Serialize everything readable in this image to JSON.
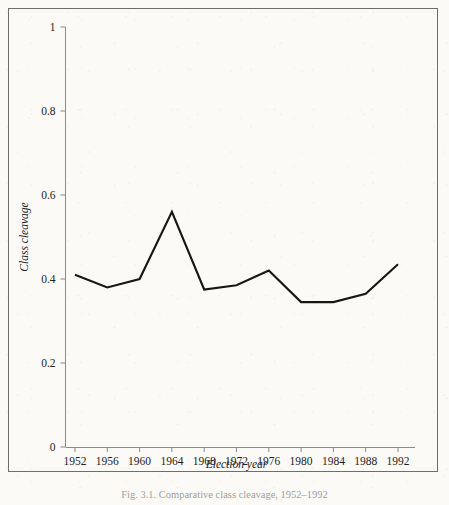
{
  "figure": {
    "caption": "Fig. 3.1.  Comparative class cleavage, 1952–1992",
    "background_color": "#fbfaf7",
    "frame_color": "#6e6e70",
    "line_color": "#161616",
    "axis_color": "#8a8a8c"
  },
  "chart_data": {
    "type": "line",
    "title": "",
    "xlabel": "Election year",
    "ylabel": "Class cleavage",
    "categories": [
      "1952",
      "1956",
      "1960",
      "1964",
      "1968",
      "1972",
      "1976",
      "1980",
      "1984",
      "1988",
      "1992"
    ],
    "x": [
      1952,
      1956,
      1960,
      1964,
      1968,
      1972,
      1976,
      1980,
      1984,
      1988,
      1992
    ],
    "values": [
      0.41,
      0.38,
      0.4,
      0.56,
      0.375,
      0.385,
      0.42,
      0.345,
      0.345,
      0.365,
      0.435
    ],
    "series": [
      {
        "name": "Class cleavage",
        "values": [
          0.41,
          0.38,
          0.4,
          0.56,
          0.375,
          0.385,
          0.42,
          0.345,
          0.345,
          0.365,
          0.435
        ]
      }
    ],
    "ylim": [
      0,
      1
    ],
    "xlim": [
      1950,
      1994
    ],
    "ytick_labels": [
      "0",
      "0.2",
      "0.4",
      "0.6",
      "0.8",
      "1"
    ],
    "ytick_values": [
      0,
      0.2,
      0.4,
      0.6,
      0.8,
      1
    ],
    "xtick_labels": [
      "1952",
      "1956",
      "1960",
      "1964",
      "1968",
      "1972",
      "1976",
      "1980",
      "1984",
      "1988",
      "1992"
    ],
    "grid": false,
    "legend": null,
    "legend_position": "none",
    "markers": false,
    "annotations": []
  }
}
